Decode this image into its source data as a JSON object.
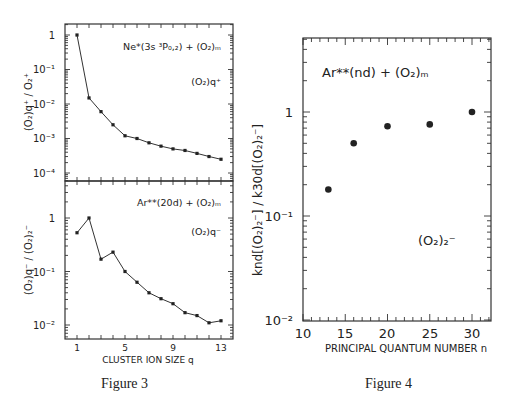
{
  "captions": {
    "figure3": "Figure 3",
    "figure4": "Figure 4"
  },
  "figure3": {
    "top_panel": {
      "annotation_main": "Ne*(3s ³P₀,₂) + (O₂)ₘ",
      "annotation_species": "(O₂)q⁺",
      "ylabel": "(O₂)q⁺ / O₂⁺",
      "ytick_labels": [
        "1",
        "10⁻¹",
        "10⁻²",
        "10⁻³",
        "10⁻⁴"
      ]
    },
    "bottom_panel": {
      "annotation_main": "Ar**(20d) + (O₂)ₘ",
      "annotation_species": "(O₂)q⁻",
      "ylabel": "(O₂)q⁻ / (O₂)₂⁻",
      "ytick_labels": [
        "1",
        "10⁻¹",
        "10⁻²"
      ]
    },
    "xlabel": "CLUSTER ION SIZE q",
    "xtick_labels": [
      "1",
      "5",
      "9",
      "13"
    ]
  },
  "figure4": {
    "annotation_main": "Ar**(nd) + (O₂)ₘ",
    "annotation_species": "(O₂)₂⁻",
    "ylabel": "knd[(O₂)₂⁻] / k30d[(O₂)₂⁻]",
    "ytick_labels": [
      "1",
      "10⁻¹",
      "10⁻²"
    ],
    "xlabel": "PRINCIPAL QUANTUM NUMBER n",
    "xtick_labels": [
      "10",
      "15",
      "20",
      "25",
      "30"
    ]
  },
  "chart_data": [
    {
      "type": "line",
      "title": "Figure 3 (top): Ne*(3s 3P0,2) + (O2)m",
      "xlabel": "CLUSTER ION SIZE q",
      "ylabel": "(O2)q+ / O2+",
      "yscale": "log",
      "ylim": [
        6e-05,
        2
      ],
      "xlim": [
        0,
        14
      ],
      "x": [
        1,
        2,
        3,
        4,
        5,
        6,
        7,
        8,
        9,
        10,
        11,
        12,
        13
      ],
      "series": [
        {
          "name": "(O2)q+",
          "values": [
            1.0,
            0.015,
            0.006,
            0.0025,
            0.0012,
            0.001,
            0.00075,
            0.0006,
            0.0005,
            0.00045,
            0.00037,
            0.0003,
            0.00025
          ]
        }
      ],
      "annotations": [
        "Ne*(3s 3P0,2) + (O2)m",
        "(O2)q+"
      ]
    },
    {
      "type": "line",
      "title": "Figure 3 (bottom): Ar**(20d) + (O2)m",
      "xlabel": "CLUSTER ION SIZE q",
      "ylabel": "(O2)q- / (O2)2-",
      "yscale": "log",
      "ylim": [
        0.005,
        10
      ],
      "xlim": [
        0,
        14
      ],
      "xticks": [
        1,
        5,
        9,
        13
      ],
      "x": [
        1,
        2,
        3,
        4,
        5,
        6,
        7,
        8,
        9,
        10,
        11,
        12,
        13
      ],
      "series": [
        {
          "name": "(O2)q-",
          "values": [
            0.53,
            1.0,
            0.17,
            0.23,
            0.1,
            0.063,
            0.04,
            0.031,
            0.025,
            0.017,
            0.015,
            0.011,
            0.012
          ]
        }
      ],
      "annotations": [
        "Ar**(20d) + (O2)m",
        "(O2)q-"
      ]
    },
    {
      "type": "scatter",
      "title": "Figure 4: Ar**(nd) + (O2)m",
      "xlabel": "PRINCIPAL QUANTUM NUMBER n",
      "ylabel": "knd[(O2)2-] / k30d[(O2)2-]",
      "yscale": "log",
      "ylim": [
        0.01,
        5
      ],
      "xlim": [
        10,
        32
      ],
      "xticks": [
        10,
        15,
        20,
        25,
        30
      ],
      "x": [
        13,
        16,
        20,
        25,
        30
      ],
      "series": [
        {
          "name": "(O2)2-",
          "values": [
            0.18,
            0.5,
            0.73,
            0.76,
            1.0
          ]
        }
      ],
      "annotations": [
        "Ar**(nd) + (O2)m",
        "(O2)2-"
      ]
    }
  ]
}
